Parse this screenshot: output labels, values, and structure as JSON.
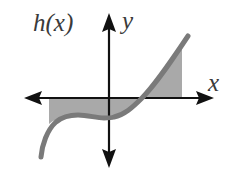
{
  "labels": {
    "function": "h(x)",
    "y_axis": "y",
    "x_axis": "x"
  },
  "colors": {
    "axis": "#111111",
    "curve": "#7a7a7a",
    "shade": "#a9a9a9",
    "label": "#3a3a3a",
    "background": "#ffffff"
  },
  "geometry": {
    "origin": [
      109,
      98
    ],
    "x_axis_range_px": [
      24,
      213
    ],
    "y_axis_range_px": [
      14,
      168
    ],
    "shaded_interval_px": [
      49,
      182
    ],
    "curve_points_px": [
      [
        41,
        157
      ],
      [
        48,
        135
      ],
      [
        60,
        119
      ],
      [
        80,
        115
      ],
      [
        98,
        118
      ],
      [
        110,
        117
      ],
      [
        125,
        112
      ],
      [
        142,
        98
      ],
      [
        160,
        78
      ],
      [
        175,
        56
      ],
      [
        188,
        36
      ]
    ]
  }
}
